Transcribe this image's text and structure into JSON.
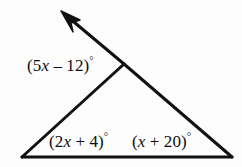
{
  "figure": {
    "kind": "geometry-diagram",
    "background_color": "#fdfdfd",
    "stroke_color": "#111111",
    "stroke_width": 3,
    "width": 242,
    "height": 167
  },
  "points": {
    "apex": {
      "x": 124,
      "y": 64
    },
    "bottom_left": {
      "x": 22,
      "y": 157
    },
    "bottom_right": {
      "x": 232,
      "y": 157
    },
    "ray_tip": {
      "x": 61,
      "y": 11
    }
  },
  "segments": [
    {
      "name": "base",
      "from": "bottom_left",
      "to": "bottom_right"
    },
    {
      "name": "left-side",
      "from": "bottom_left",
      "to": "apex"
    },
    {
      "name": "right-side",
      "from": "apex",
      "to": "bottom_right"
    },
    {
      "name": "extended-ray",
      "from": "apex",
      "to": "ray_tip"
    }
  ],
  "arrowhead": {
    "at": "ray_tip",
    "filled": true,
    "points_toward": "upper-left"
  },
  "labels": {
    "exterior_angle": {
      "open_paren": "(",
      "coefficient": "5",
      "variable": "x",
      "operator": "–",
      "constant": "12",
      "close_paren": ")",
      "degree": "°",
      "text": "(5x – 12)°"
    },
    "interior_left_angle": {
      "open_paren": "(",
      "coefficient": "2",
      "variable": "x",
      "operator": "+",
      "constant": "4",
      "close_paren": ")",
      "degree": "°",
      "text": "(2x + 4)°"
    },
    "interior_right_angle": {
      "open_paren": "(",
      "coefficient": "",
      "variable": "x",
      "operator": "+",
      "constant": "20",
      "close_paren": ")",
      "degree": "°",
      "text": "(x + 20)°"
    }
  }
}
